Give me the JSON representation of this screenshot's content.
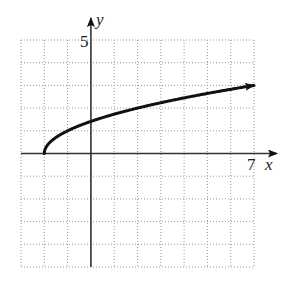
{
  "chart_data": {
    "type": "line",
    "title": "",
    "function": "y = sqrt(x + 2)",
    "xlabel": "x",
    "ylabel": "y",
    "xlim": [
      -3,
      7
    ],
    "ylim": [
      -5,
      5
    ],
    "x_tick_labels": [
      {
        "value": 7,
        "label": "7"
      }
    ],
    "y_tick_labels": [
      {
        "value": 5,
        "label": "5"
      }
    ],
    "grid": true,
    "grid_style": "dotted",
    "grid_step": 1,
    "legend": null,
    "series": [
      {
        "name": "f(x)",
        "start_point": [
          -2,
          0
        ],
        "end_arrow": true,
        "x": [
          -2,
          -1.75,
          -1.5,
          -1,
          0,
          1,
          2,
          3,
          4,
          5,
          6,
          7
        ],
        "values": [
          0,
          0.5,
          0.71,
          1,
          1.41,
          1.73,
          2,
          2.24,
          2.45,
          2.65,
          2.83,
          3
        ]
      }
    ]
  },
  "labels": {
    "x_axis": "x",
    "y_axis": "y",
    "x_max_tick": "7",
    "y_max_tick": "5"
  },
  "colors": {
    "curve": "#111111",
    "axis": "#333333",
    "grid": "#9a9a9a"
  }
}
